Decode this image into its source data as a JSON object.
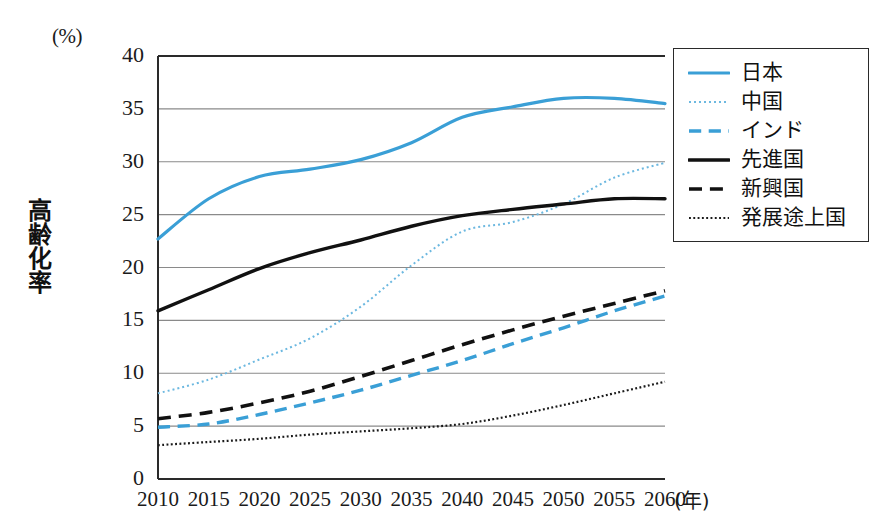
{
  "chart_data": {
    "type": "line",
    "title": "",
    "xlabel": "年",
    "ylabel": "高齢化率",
    "yunit": "(%)",
    "xunit_label": "(年)",
    "grid": true,
    "legend_position": "right-top",
    "xlim": [
      2010,
      2060
    ],
    "ylim": [
      0,
      40
    ],
    "ytick_step": 5,
    "x": [
      2010,
      2015,
      2020,
      2025,
      2030,
      2035,
      2040,
      2045,
      2050,
      2055,
      2060
    ],
    "categories": [
      "2010",
      "2015",
      "2020",
      "2025",
      "2030",
      "2035",
      "2040",
      "2045",
      "2050",
      "2055",
      "2060"
    ],
    "yticks": [
      "0",
      "5",
      "10",
      "15",
      "20",
      "25",
      "30",
      "35",
      "40"
    ],
    "series": [
      {
        "name": "日本",
        "color": "#3a9fd6",
        "style": "solid",
        "width": 3.2,
        "values": [
          22.7,
          26.5,
          28.6,
          29.3,
          30.2,
          31.8,
          34.2,
          35.2,
          36.0,
          36.0,
          35.5
        ]
      },
      {
        "name": "中国",
        "color": "#6cb8e0",
        "style": "dotted",
        "width": 2.0,
        "values": [
          8.1,
          9.4,
          11.3,
          13.3,
          16.3,
          20.2,
          23.4,
          24.3,
          26.0,
          28.5,
          29.9
        ]
      },
      {
        "name": "インド",
        "color": "#3a9fd6",
        "style": "dashed",
        "width": 3.4,
        "values": [
          4.9,
          5.2,
          6.1,
          7.2,
          8.4,
          9.8,
          11.2,
          12.8,
          14.3,
          15.9,
          17.3
        ]
      },
      {
        "name": "先進国",
        "color": "#111111",
        "style": "solid",
        "width": 3.4,
        "values": [
          15.9,
          17.9,
          19.9,
          21.4,
          22.6,
          23.9,
          24.9,
          25.5,
          26.0,
          26.5,
          26.5
        ]
      },
      {
        "name": "新興国",
        "color": "#111111",
        "style": "dashed",
        "width": 3.6,
        "values": [
          5.7,
          6.3,
          7.2,
          8.3,
          9.7,
          11.2,
          12.7,
          14.1,
          15.4,
          16.6,
          17.8
        ]
      },
      {
        "name": "発展途上国",
        "color": "#1a1a1a",
        "style": "fine-dotted",
        "width": 2.2,
        "values": [
          3.2,
          3.5,
          3.8,
          4.2,
          4.5,
          4.8,
          5.2,
          6.0,
          7.0,
          8.1,
          9.2
        ]
      }
    ]
  },
  "axes": {
    "y_unit_text": "(%)",
    "y_axis_title": "高齢化率",
    "x_unit_text": "(年)"
  },
  "legend": {
    "items": [
      {
        "label": "日本"
      },
      {
        "label": "中国"
      },
      {
        "label": "インド"
      },
      {
        "label": "先進国"
      },
      {
        "label": "新興国"
      },
      {
        "label": "発展途上国"
      }
    ]
  }
}
